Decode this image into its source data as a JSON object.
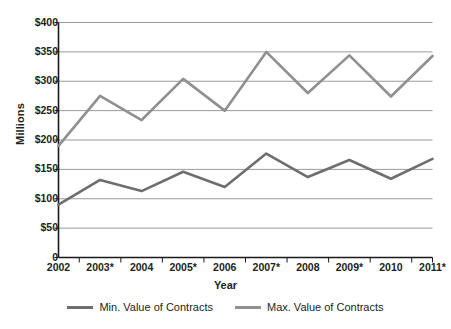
{
  "chart_data": {
    "type": "line",
    "title": "",
    "xlabel": "Year",
    "ylabel": "Millions",
    "categories": [
      "2002",
      "2003*",
      "2004",
      "2005*",
      "2006",
      "2007*",
      "2008",
      "2009*",
      "2010",
      "2011*"
    ],
    "series": [
      {
        "name": "Min. Value of Contracts",
        "color": "#6e6e6e",
        "values": [
          90,
          132,
          113,
          146,
          120,
          177,
          137,
          166,
          134,
          168
        ]
      },
      {
        "name": "Max. Value of Contracts",
        "color": "#909090",
        "values": [
          190,
          275,
          234,
          304,
          250,
          350,
          280,
          344,
          274,
          343
        ]
      }
    ],
    "ylim": [
      0,
      400
    ],
    "ytick_values": [
      0,
      50,
      100,
      150,
      200,
      250,
      300,
      350,
      400
    ],
    "ytick_labels": [
      "0",
      "$50",
      "$100",
      "$150",
      "$200",
      "$250",
      "$300",
      "$350",
      "$400"
    ],
    "grid": "horizontal",
    "legend_position": "bottom",
    "gridline_color": "#9a9a9a",
    "axis_color": "#1a1a1a",
    "background": "#ffffff"
  },
  "legend": {
    "items": [
      {
        "label": "Min. Value of Contracts"
      },
      {
        "label": "Max. Value of Contracts"
      }
    ]
  }
}
